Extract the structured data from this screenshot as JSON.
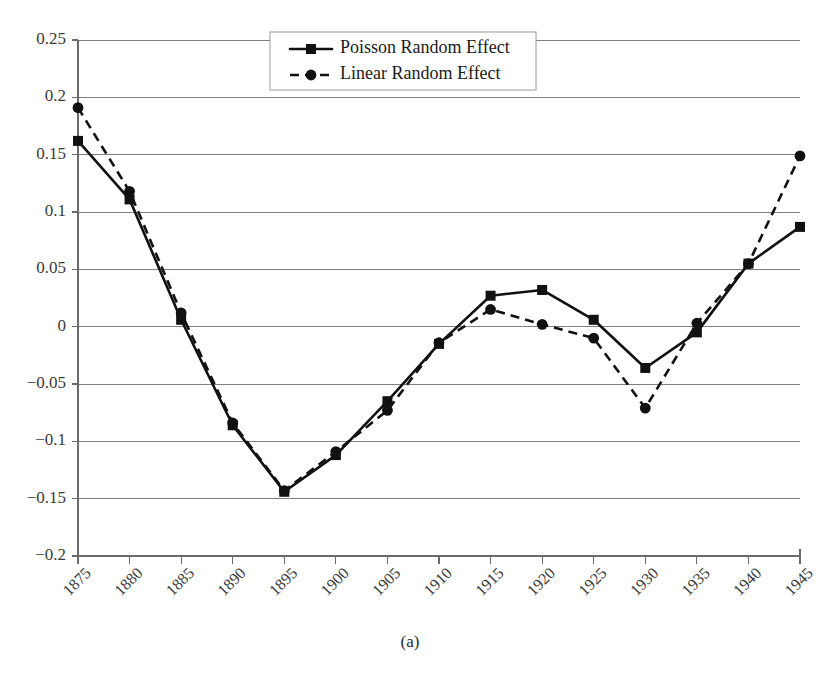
{
  "figure": {
    "caption": "(a)"
  },
  "chart_data": {
    "type": "line",
    "title": "",
    "xlabel": "",
    "ylabel": "",
    "x": [
      1875,
      1880,
      1885,
      1890,
      1895,
      1900,
      1905,
      1910,
      1915,
      1920,
      1925,
      1930,
      1935,
      1940,
      1945
    ],
    "xtick_labels": [
      "1875",
      "1880",
      "1885",
      "1890",
      "1895",
      "1900",
      "1905",
      "1910",
      "1915",
      "1920",
      "1925",
      "1930",
      "1935",
      "1940",
      "1945"
    ],
    "ytick_labels": [
      "0.25",
      "0.2",
      "0.15",
      "0.1",
      "0.05",
      "0",
      "−0.05",
      "−0.1",
      "−0.15",
      "−0.2"
    ],
    "ytick_values": [
      0.25,
      0.2,
      0.15,
      0.1,
      0.05,
      0,
      -0.05,
      -0.1,
      -0.15,
      -0.2
    ],
    "ylim": [
      -0.2,
      0.25
    ],
    "xlim": [
      1875,
      1945
    ],
    "grid": "horizontal",
    "legend_position": "top-center",
    "series": [
      {
        "name": "Poisson Random Effect",
        "line_style": "solid",
        "marker": "square",
        "color": "#111111",
        "values": [
          0.162,
          0.111,
          0.006,
          -0.086,
          -0.144,
          -0.112,
          -0.065,
          -0.015,
          0.027,
          0.032,
          0.006,
          -0.036,
          -0.005,
          0.055,
          0.087
        ]
      },
      {
        "name": "Linear Random Effect",
        "line_style": "dashed",
        "marker": "circle",
        "color": "#111111",
        "values": [
          0.191,
          0.118,
          0.012,
          -0.084,
          -0.143,
          -0.109,
          -0.073,
          -0.014,
          0.015,
          0.002,
          -0.01,
          -0.071,
          0.003,
          0.055,
          0.149
        ]
      }
    ]
  }
}
